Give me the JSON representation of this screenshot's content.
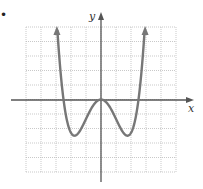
{
  "bullet": "•",
  "chart_data": {
    "type": "line",
    "title": "",
    "xlabel": "x",
    "ylabel": "y",
    "xlim": [
      -5,
      5
    ],
    "ylim": [
      -5,
      5
    ],
    "grid": true,
    "series": [
      {
        "name": "f(x)",
        "x": [
          -3.0,
          -2.5,
          -2.0,
          -1.5,
          -1.0,
          -0.5,
          0,
          0.5,
          1.0,
          1.5,
          2.0,
          2.5,
          3.0
        ],
        "y": [
          5.0,
          0.0,
          -1.9,
          -2.3,
          -1.6,
          -0.4,
          0.0,
          -0.4,
          -1.6,
          -2.3,
          -1.9,
          0.0,
          5.0
        ]
      }
    ],
    "annotations": [
      "arrowheads at both upper ends of curve",
      "arrowheads on positive x and y axes"
    ]
  }
}
